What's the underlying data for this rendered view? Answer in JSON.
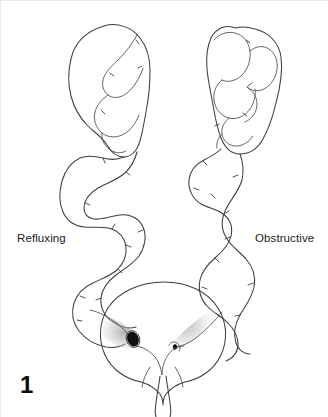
{
  "figure": {
    "number": "1",
    "domain": "medical-illustration",
    "background_color": "#ffffff",
    "line_color": "#3d3d3d",
    "label_color": "#1a1a1a"
  },
  "labels": {
    "left": "Refluxing",
    "right": "Obstructive"
  },
  "annotations": {
    "left_side_name": "refluxing",
    "right_side_name": "obstructive",
    "left_orifice_description": "wide gaping ureteric orifice",
    "right_orifice_description": "pinhole stenotic ureteric orifice",
    "bladder_name": "urinary bladder",
    "urethra_name": "urethra",
    "trigone_name": "interureteric ridge"
  },
  "colors": {
    "ink": "#3d3d3d",
    "ink_dark": "#111111",
    "stipple": "#b8b8b8",
    "page": "#ffffff"
  },
  "icons": {
    "left_kidney": "kidney-icon",
    "right_kidney": "kidney-icon",
    "left_ureter": "ureter-icon",
    "right_ureter": "ureter-icon",
    "bladder": "bladder-icon",
    "left_orifice": "wide-orifice-icon",
    "right_orifice": "pinhole-orifice-icon"
  }
}
